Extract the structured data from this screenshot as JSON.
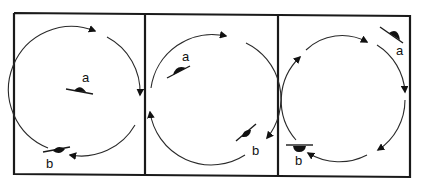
{
  "figure": {
    "panels": [
      {
        "id": "panel-1",
        "objects": [
          {
            "label": "a",
            "position": "center"
          },
          {
            "label": "b",
            "position": "bottom-left on circle"
          }
        ],
        "rotation": "clockwise"
      },
      {
        "id": "panel-2",
        "objects": [
          {
            "label": "a",
            "position": "upper-left inside circle"
          },
          {
            "label": "b",
            "position": "bottom-right on circle"
          }
        ],
        "rotation": "clockwise"
      },
      {
        "id": "panel-3",
        "objects": [
          {
            "label": "a",
            "position": "upper-right outside circle"
          },
          {
            "label": "b",
            "position": "bottom-left on circle"
          }
        ],
        "rotation": "clockwise"
      }
    ],
    "colors": {
      "ink": "#111111",
      "background": "#ffffff"
    }
  }
}
